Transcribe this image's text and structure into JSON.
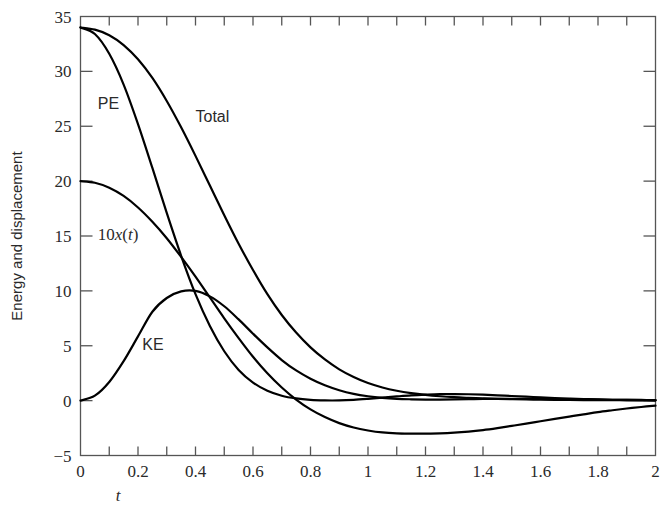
{
  "chart_data": {
    "type": "line",
    "title": "",
    "xlabel": "t",
    "ylabel": "Energy and displacement",
    "xlim": [
      0,
      2
    ],
    "ylim": [
      -5,
      35
    ],
    "grid": false,
    "legend_position": "inline-annotations",
    "x_ticks_major": [
      0,
      0.2,
      0.4,
      0.6,
      0.8,
      1,
      1.2,
      1.4,
      1.6,
      1.8,
      2
    ],
    "x_ticklabels": [
      "0",
      "0.2",
      "0.4",
      "0.6",
      "0.8",
      "1",
      "1.2",
      "1.4",
      "1.6",
      "1.8",
      "2"
    ],
    "x_tick_step_minor": 0.1,
    "y_ticks": [
      -5,
      0,
      5,
      10,
      15,
      20,
      25,
      30,
      35
    ],
    "y_ticklabels": [
      "−5",
      "0",
      "5",
      "10",
      "15",
      "20",
      "25",
      "30",
      "35"
    ],
    "line_color": "#000000",
    "line_width": 2.2,
    "frame_color": "#555555",
    "ticks_direction": "in",
    "ticks_all_sides": true,
    "x": [
      0,
      0.05,
      0.1,
      0.15,
      0.2,
      0.25,
      0.3,
      0.35,
      0.4,
      0.45,
      0.5,
      0.55,
      0.6,
      0.65,
      0.7,
      0.75,
      0.8,
      0.85,
      0.9,
      0.95,
      1.0,
      1.05,
      1.1,
      1.15,
      1.2,
      1.25,
      1.3,
      1.35,
      1.4,
      1.45,
      1.5,
      1.55,
      1.6,
      1.65,
      1.7,
      1.75,
      1.8,
      1.85,
      1.9,
      1.95,
      2.0
    ],
    "series": [
      {
        "name": "PE",
        "label": "PE",
        "label_xy": [
          0.06,
          26.6
        ],
        "values": [
          34.0,
          33.4,
          31.6,
          28.8,
          25.2,
          21.2,
          17.1,
          13.2,
          9.7,
          6.8,
          4.5,
          2.8,
          1.65,
          0.9,
          0.45,
          0.2,
          0.07,
          0.02,
          0.02,
          0.07,
          0.16,
          0.27,
          0.38,
          0.48,
          0.55,
          0.6,
          0.6,
          0.58,
          0.54,
          0.48,
          0.42,
          0.36,
          0.3,
          0.24,
          0.19,
          0.15,
          0.11,
          0.08,
          0.06,
          0.04,
          0.03
        ]
      },
      {
        "name": "Total",
        "label": "Total",
        "label_xy": [
          0.4,
          25.4
        ],
        "values": [
          34.0,
          33.8,
          33.3,
          32.4,
          31.1,
          29.4,
          27.3,
          24.9,
          22.3,
          19.6,
          16.9,
          14.3,
          11.9,
          9.7,
          7.8,
          6.2,
          4.85,
          3.75,
          2.85,
          2.15,
          1.6,
          1.2,
          0.9,
          0.68,
          0.52,
          0.4,
          0.31,
          0.25,
          0.2,
          0.16,
          0.13,
          0.11,
          0.09,
          0.075,
          0.06,
          0.05,
          0.042,
          0.035,
          0.03,
          0.025,
          0.02
        ]
      },
      {
        "name": "10x(t)",
        "label": "10x(t)",
        "label_xy": [
          0.06,
          14.6
        ],
        "values": [
          20.0,
          19.85,
          19.4,
          18.65,
          17.6,
          16.3,
          14.8,
          13.1,
          11.3,
          9.4,
          7.5,
          5.7,
          4.0,
          2.5,
          1.2,
          0.1,
          -0.8,
          -1.5,
          -2.05,
          -2.45,
          -2.72,
          -2.9,
          -2.98,
          -3.0,
          -3.0,
          -2.98,
          -2.92,
          -2.82,
          -2.68,
          -2.5,
          -2.3,
          -2.1,
          -1.88,
          -1.66,
          -1.45,
          -1.25,
          -1.05,
          -0.88,
          -0.72,
          -0.58,
          -0.45
        ]
      },
      {
        "name": "KE",
        "label": "KE",
        "label_xy": [
          0.215,
          4.6
        ],
        "values": [
          0.0,
          0.45,
          1.7,
          3.6,
          5.85,
          8.1,
          9.35,
          9.95,
          10.0,
          9.5,
          8.6,
          7.4,
          6.1,
          4.85,
          3.7,
          2.75,
          2.0,
          1.4,
          0.95,
          0.62,
          0.4,
          0.25,
          0.16,
          0.12,
          0.1,
          0.1,
          0.11,
          0.13,
          0.15,
          0.16,
          0.16,
          0.16,
          0.15,
          0.14,
          0.13,
          0.11,
          0.1,
          0.08,
          0.07,
          0.06,
          0.05
        ]
      }
    ],
    "annotations": [
      {
        "text": "PE",
        "x": 0.06,
        "y": 26.6
      },
      {
        "text": "Total",
        "x": 0.4,
        "y": 25.4
      },
      {
        "text": "10x(t)",
        "x": 0.06,
        "y": 14.6
      },
      {
        "text": "KE",
        "x": 0.215,
        "y": 4.6
      }
    ]
  }
}
